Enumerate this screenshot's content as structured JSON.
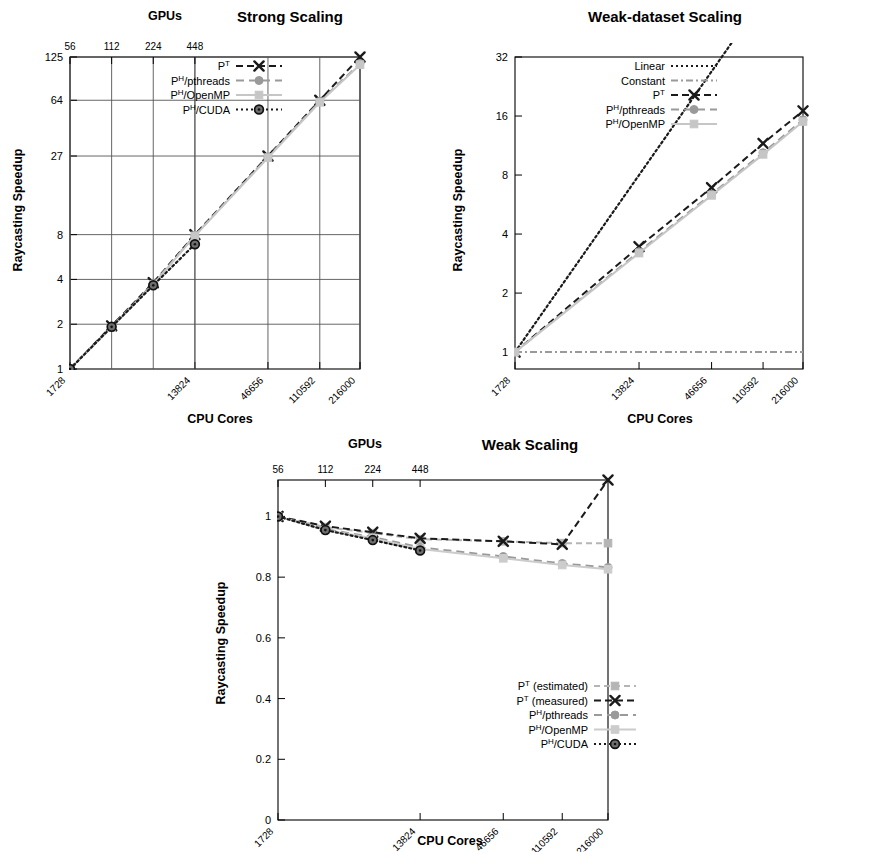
{
  "charts": [
    {
      "id": "strong",
      "chart_data": {
        "type": "line",
        "title": "Strong Scaling",
        "xlabel": "CPU Cores",
        "ylabel": "Raycasting Speedup",
        "top_axis_label": "GPUs",
        "xticks": [
          "1728",
          "13824",
          "46656",
          "110592",
          "216000"
        ],
        "xtick_values": [
          1728,
          13824,
          46656,
          110592,
          216000
        ],
        "top_xticks": [
          "56",
          "112",
          "224",
          "448"
        ],
        "top_xtick_values": [
          1728,
          3456,
          6912,
          13824
        ],
        "yticks": [
          "1",
          "2",
          "4",
          "8",
          "27",
          "64",
          "125"
        ],
        "ytick_values": [
          1,
          2,
          4,
          8,
          27,
          64,
          125
        ],
        "ylim": [
          1,
          125
        ],
        "xlim": [
          1728,
          216000
        ],
        "yscale": "log",
        "xscale": "log",
        "grid": true,
        "legend_position": "top-left",
        "series": [
          {
            "name": "P^T",
            "label_base": "P",
            "label_sup": "T",
            "label_rest": "",
            "color": "#1a1a1a",
            "dash": "7,4",
            "marker": "x",
            "x": [
              1728,
              3456,
              6912,
              13824,
              46656,
              110592,
              216000
            ],
            "values": [
              1,
              1.95,
              3.8,
              8.0,
              27.0,
              64.0,
              125.0
            ]
          },
          {
            "name": "P^H/pthreads",
            "label_base": "P",
            "label_sup": "H",
            "label_rest": "/pthreads",
            "color": "#9a9a9a",
            "dash": "8,5",
            "marker": "circle",
            "x": [
              1728,
              3456,
              6912,
              13824,
              46656,
              110592,
              216000
            ],
            "values": [
              1,
              1.93,
              3.75,
              7.9,
              26.6,
              63.0,
              113.0
            ]
          },
          {
            "name": "P^H/OpenMP",
            "label_base": "P",
            "label_sup": "H",
            "label_rest": "/OpenMP",
            "color": "#c6c6c6",
            "dash": "0",
            "marker": "square",
            "x": [
              1728,
              3456,
              6912,
              13824,
              46656,
              110592,
              216000
            ],
            "values": [
              1,
              1.9,
              3.7,
              7.85,
              26.3,
              62.0,
              111.0
            ]
          },
          {
            "name": "P^H/CUDA",
            "label_base": "P",
            "label_sup": "H",
            "label_rest": "/CUDA",
            "color": "#1a1a1a",
            "dash": "2,3",
            "marker": "circle-dot",
            "x": [
              1728,
              3456,
              6912,
              13824
            ],
            "values": [
              1,
              1.92,
              3.65,
              6.9
            ]
          }
        ]
      }
    },
    {
      "id": "weak-dataset",
      "chart_data": {
        "type": "line",
        "title": "Weak-dataset Scaling",
        "xlabel": "CPU Cores",
        "ylabel": "Raycasting Speedup",
        "top_axis_label": "",
        "xticks": [
          "1728",
          "13824",
          "46656",
          "110592",
          "216000"
        ],
        "xtick_values": [
          1728,
          13824,
          46656,
          110592,
          216000
        ],
        "yticks": [
          "1",
          "2",
          "4",
          "8",
          "16",
          "32"
        ],
        "ytick_values": [
          1,
          2,
          4,
          8,
          16,
          32
        ],
        "ylim": [
          0.82,
          32
        ],
        "xlim": [
          1728,
          216000
        ],
        "yscale": "log",
        "xscale": "log",
        "grid": false,
        "legend_position": "top-left",
        "series": [
          {
            "name": "Linear",
            "label_base": "Linear",
            "label_sup": "",
            "label_rest": "",
            "color": "#1a1a1a",
            "dash": "2,3",
            "marker": "none",
            "x": [
              1728,
              216000
            ],
            "values": [
              1,
              125
            ]
          },
          {
            "name": "Constant",
            "label_base": "Constant",
            "label_sup": "",
            "label_rest": "",
            "color": "#9a9a9a",
            "dash": "7,3,2,3",
            "marker": "none",
            "x": [
              1728,
              216000
            ],
            "values": [
              1,
              1
            ]
          },
          {
            "name": "P^T",
            "label_base": "P",
            "label_sup": "T",
            "label_rest": "",
            "color": "#1a1a1a",
            "dash": "7,4",
            "marker": "x",
            "x": [
              1728,
              13824,
              46656,
              110592,
              216000
            ],
            "values": [
              1,
              3.45,
              6.9,
              11.6,
              17.0
            ]
          },
          {
            "name": "P^H/pthreads",
            "label_base": "P",
            "label_sup": "H",
            "label_rest": "/pthreads",
            "color": "#9a9a9a",
            "dash": "8,5",
            "marker": "circle",
            "x": [
              1728,
              13824,
              46656,
              110592,
              216000
            ],
            "values": [
              1,
              3.25,
              6.4,
              10.4,
              15.3
            ]
          },
          {
            "name": "P^H/OpenMP",
            "label_base": "P",
            "label_sup": "H",
            "label_rest": "/OpenMP",
            "color": "#c6c6c6",
            "dash": "0",
            "marker": "square",
            "x": [
              1728,
              13824,
              46656,
              110592,
              216000
            ],
            "values": [
              1,
              3.2,
              6.3,
              10.2,
              15.0
            ]
          }
        ]
      }
    },
    {
      "id": "weak",
      "chart_data": {
        "type": "line",
        "title": "Weak Scaling",
        "xlabel": "CPU Cores",
        "ylabel": "Raycasting Speedup",
        "top_axis_label": "GPUs",
        "xticks": [
          "1728",
          "13824",
          "46656",
          "110592",
          "216000"
        ],
        "xtick_values": [
          1728,
          13824,
          46656,
          110592,
          216000
        ],
        "top_xticks": [
          "56",
          "112",
          "224",
          "448"
        ],
        "top_xtick_values": [
          1728,
          3456,
          6912,
          13824
        ],
        "yticks": [
          "0",
          "0.2",
          "0.4",
          "0.6",
          "0.8",
          "1"
        ],
        "ytick_values": [
          0,
          0.2,
          0.4,
          0.6,
          0.8,
          1
        ],
        "ylim": [
          0,
          1.12
        ],
        "xlim": [
          1728,
          216000
        ],
        "yscale": "linear",
        "xscale": "log",
        "grid": false,
        "legend_position": "bottom-right",
        "series": [
          {
            "name": "P^T (estimated)",
            "label_base": "P",
            "label_sup": "T",
            "label_rest": " (estimated)",
            "color": "#b5b5b5",
            "dash": "6,4",
            "marker": "square",
            "x": [
              1728,
              3456,
              6912,
              13824,
              46656,
              110592,
              216000
            ],
            "values": [
              1.0,
              0.965,
              0.945,
              0.925,
              0.918,
              0.912,
              0.912
            ]
          },
          {
            "name": "P^T (measured)",
            "label_base": "P",
            "label_sup": "T",
            "label_rest": " (measured)",
            "color": "#1a1a1a",
            "dash": "7,4",
            "marker": "x",
            "x": [
              1728,
              3456,
              6912,
              13824,
              46656,
              110592,
              216000
            ],
            "values": [
              1.0,
              0.968,
              0.948,
              0.928,
              0.918,
              0.908,
              1.12
            ]
          },
          {
            "name": "P^H/pthreads",
            "label_base": "P",
            "label_sup": "H",
            "label_rest": "/pthreads",
            "color": "#9a9a9a",
            "dash": "8,5",
            "marker": "circle",
            "x": [
              1728,
              3456,
              6912,
              13824,
              46656,
              110592,
              216000
            ],
            "values": [
              1.0,
              0.958,
              0.932,
              0.898,
              0.868,
              0.845,
              0.832
            ]
          },
          {
            "name": "P^H/OpenMP",
            "label_base": "P",
            "label_sup": "H",
            "label_rest": "/OpenMP",
            "color": "#cccccc",
            "dash": "0",
            "marker": "square",
            "x": [
              1728,
              3456,
              6912,
              13824,
              46656,
              110592,
              216000
            ],
            "values": [
              1.0,
              0.955,
              0.928,
              0.893,
              0.862,
              0.84,
              0.826
            ]
          },
          {
            "name": "P^H/CUDA",
            "label_base": "P",
            "label_sup": "H",
            "label_rest": "/CUDA",
            "color": "#1a1a1a",
            "dash": "2,3",
            "marker": "circle-dot",
            "x": [
              1728,
              3456,
              6912,
              13824
            ],
            "values": [
              1.0,
              0.955,
              0.922,
              0.888
            ]
          }
        ]
      }
    }
  ]
}
